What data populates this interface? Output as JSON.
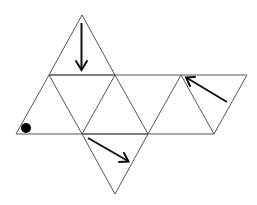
{
  "diagram": {
    "type": "octahedron-net",
    "colors": {
      "background": "#ffffff",
      "edge": "#555555",
      "arrow": "#111111",
      "dot": "#000000"
    },
    "triangles": 8,
    "markers": [
      {
        "kind": "arrow",
        "name": "arrow-down",
        "direction": "down",
        "location": "top triangle"
      },
      {
        "kind": "arrow",
        "name": "arrow-up-left",
        "direction": "up-left",
        "location": "right-end triangle"
      },
      {
        "kind": "arrow",
        "name": "arrow-down-right",
        "direction": "down-right",
        "location": "bottom triangle"
      },
      {
        "kind": "dot",
        "name": "dot",
        "location": "bottom-left corner of left triangle"
      }
    ]
  }
}
